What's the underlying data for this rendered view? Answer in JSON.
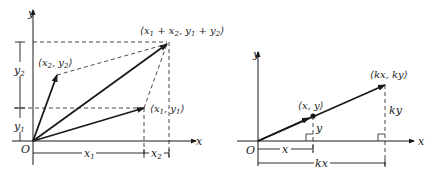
{
  "left_diagram": {
    "title": "Vector addition",
    "axis_x_label": "x",
    "axis_y_label": "y",
    "origin_label": "O",
    "points": {
      "sum": {
        "label_prefix": "⟨x",
        "label": "⟨x₁ + x₂, y₁ + y₂⟩"
      },
      "v2": {
        "label": "⟨x₂, y₂⟩"
      },
      "v1": {
        "label": "⟨x₁, y₁⟩"
      }
    },
    "brackets": {
      "y1": "y₁",
      "y2": "y₂",
      "x1": "x₁",
      "x2": "x₂"
    }
  },
  "right_diagram": {
    "title": "Scalar multiplication",
    "axis_x_label": "x",
    "axis_y_label": "y",
    "origin_label": "O",
    "points": {
      "v": {
        "label": "⟨x, y⟩"
      },
      "kv": {
        "label": "⟨kx, ky⟩"
      }
    },
    "brackets": {
      "x": "x",
      "kx": "kx",
      "y": "y",
      "ky": "ky"
    }
  },
  "colors": {
    "line": "#1a1a1a",
    "background": "#ffffff"
  }
}
